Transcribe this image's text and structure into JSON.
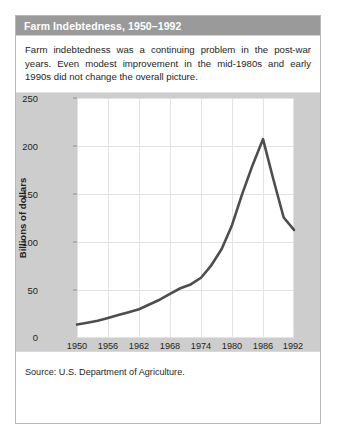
{
  "figure": {
    "title": "Farm Indebtedness, 1950–1992",
    "caption": "Farm indebtedness was a continuing problem in the post-war years. Even modest improvement in the mid-1980s and early 1990s did not change the overall picture.",
    "source": "Source: U.S. Department of Agriculture.",
    "colors": {
      "title_bar": "#9a9a9a",
      "title_text": "#ffffff",
      "chart_band": "#cdcdcd",
      "plot_background": "#ffffff",
      "grid": "#e3e3e3",
      "line": "#4d4d4d",
      "text": "#231f20",
      "frame": "#b9b9b9"
    }
  },
  "chart_data": {
    "type": "line",
    "title": "Farm Indebtedness, 1950–1992",
    "xlabel": "Year",
    "ylabel": "Billions of dollars",
    "xlim": [
      1950,
      1992
    ],
    "ylim": [
      0,
      250
    ],
    "yticks": [
      0,
      50,
      100,
      150,
      200,
      250
    ],
    "xticks": [
      1950,
      1956,
      1962,
      1968,
      1974,
      1980,
      1986,
      1992
    ],
    "grid": true,
    "legend": "none",
    "series": [
      {
        "name": "Farm indebtedness",
        "unit": "billions of dollars",
        "x": [
          1950,
          1952,
          1954,
          1956,
          1958,
          1960,
          1962,
          1964,
          1966,
          1968,
          1970,
          1972,
          1974,
          1976,
          1978,
          1980,
          1982,
          1984,
          1986,
          1988,
          1990,
          1992
        ],
        "values": [
          13,
          15,
          17,
          20,
          23,
          26,
          29,
          34,
          39,
          45,
          51,
          55,
          62,
          75,
          92,
          117,
          150,
          180,
          207,
          165,
          125,
          112
        ]
      }
    ]
  },
  "axis": {
    "y_ticks": [
      "250",
      "200",
      "150",
      "100",
      "50",
      "0"
    ],
    "x_ticks": [
      "1950",
      "1956",
      "1962",
      "1968",
      "1974",
      "1980",
      "1986",
      "1992"
    ],
    "y_title": "Billions of dollars",
    "x_title": "Year"
  }
}
